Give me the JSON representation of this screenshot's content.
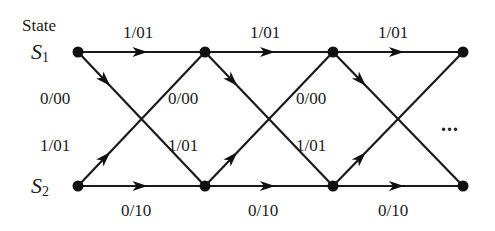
{
  "diagram": {
    "type": "trellis",
    "state_header": "State",
    "states": [
      {
        "id": "S1",
        "name": "S",
        "sub": "1",
        "y": 52
      },
      {
        "id": "S2",
        "name": "S",
        "sub": "2",
        "y": 186
      }
    ],
    "stage_x": [
      78,
      205,
      333,
      463
    ],
    "continuation": "...",
    "transitions": [
      {
        "stage": 0,
        "from": "S1",
        "to": "S1",
        "label": "1/01"
      },
      {
        "stage": 0,
        "from": "S1",
        "to": "S2",
        "label": "0/00"
      },
      {
        "stage": 0,
        "from": "S2",
        "to": "S1",
        "label": "1/01"
      },
      {
        "stage": 0,
        "from": "S2",
        "to": "S2",
        "label": "0/10"
      },
      {
        "stage": 1,
        "from": "S1",
        "to": "S1",
        "label": "1/01"
      },
      {
        "stage": 1,
        "from": "S1",
        "to": "S2",
        "label": "0/00"
      },
      {
        "stage": 1,
        "from": "S2",
        "to": "S1",
        "label": "1/01"
      },
      {
        "stage": 1,
        "from": "S2",
        "to": "S2",
        "label": "0/10"
      },
      {
        "stage": 2,
        "from": "S1",
        "to": "S1",
        "label": "1/01"
      },
      {
        "stage": 2,
        "from": "S1",
        "to": "S2",
        "label": "0/00"
      },
      {
        "stage": 2,
        "from": "S2",
        "to": "S1",
        "label": "1/01"
      },
      {
        "stage": 2,
        "from": "S2",
        "to": "S2",
        "label": "0/10"
      }
    ],
    "labels": {
      "top": [
        "1/01",
        "1/01",
        "1/01"
      ],
      "upper_mid": [
        "0/00",
        "0/00",
        "0/00"
      ],
      "lower_mid": [
        "1/01",
        "1/01",
        "1/01"
      ],
      "bottom": [
        "0/10",
        "0/10",
        "0/10"
      ]
    }
  }
}
